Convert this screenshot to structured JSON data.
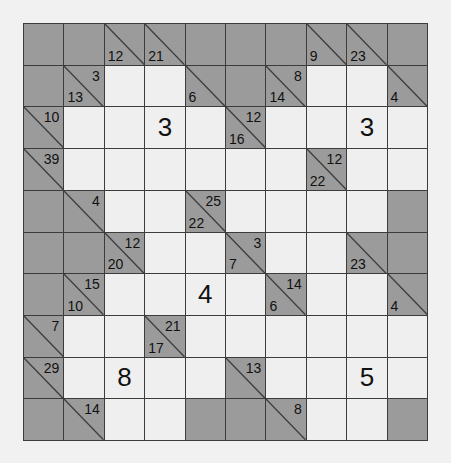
{
  "puzzle": {
    "type": "kakuro",
    "rows": 10,
    "cols": 10,
    "colors": {
      "background": "#f1f1f1",
      "white_cell": "#efefef",
      "block_cell": "#9b9b9b",
      "grid_line": "#3c3c3c",
      "text": "#111111"
    },
    "grid": [
      [
        {
          "t": "B"
        },
        {
          "t": "B"
        },
        {
          "t": "C",
          "d": "12"
        },
        {
          "t": "C",
          "d": "21"
        },
        {
          "t": "B"
        },
        {
          "t": "B"
        },
        {
          "t": "B"
        },
        {
          "t": "C",
          "d": "9"
        },
        {
          "t": "C",
          "d": "23"
        },
        {
          "t": "B"
        }
      ],
      [
        {
          "t": "B"
        },
        {
          "t": "C",
          "a": "3",
          "d": "13"
        },
        {
          "t": "W"
        },
        {
          "t": "W"
        },
        {
          "t": "C",
          "d": "6"
        },
        {
          "t": "B"
        },
        {
          "t": "C",
          "a": "8",
          "d": "14"
        },
        {
          "t": "W"
        },
        {
          "t": "W"
        },
        {
          "t": "C",
          "d": "4"
        }
      ],
      [
        {
          "t": "C",
          "a": "10"
        },
        {
          "t": "W"
        },
        {
          "t": "W"
        },
        {
          "t": "W",
          "v": "3"
        },
        {
          "t": "W"
        },
        {
          "t": "C",
          "a": "12",
          "d": "16"
        },
        {
          "t": "W"
        },
        {
          "t": "W"
        },
        {
          "t": "W",
          "v": "3"
        },
        {
          "t": "W"
        }
      ],
      [
        {
          "t": "C",
          "a": "39"
        },
        {
          "t": "W"
        },
        {
          "t": "W"
        },
        {
          "t": "W"
        },
        {
          "t": "W"
        },
        {
          "t": "W"
        },
        {
          "t": "W"
        },
        {
          "t": "C",
          "a": "12",
          "d": "22"
        },
        {
          "t": "W"
        },
        {
          "t": "W"
        }
      ],
      [
        {
          "t": "B"
        },
        {
          "t": "C",
          "a": "4"
        },
        {
          "t": "W"
        },
        {
          "t": "W"
        },
        {
          "t": "C",
          "a": "25",
          "d": "22"
        },
        {
          "t": "W"
        },
        {
          "t": "W"
        },
        {
          "t": "W"
        },
        {
          "t": "W"
        },
        {
          "t": "B"
        }
      ],
      [
        {
          "t": "B"
        },
        {
          "t": "B"
        },
        {
          "t": "C",
          "a": "12",
          "d": "20"
        },
        {
          "t": "W"
        },
        {
          "t": "W"
        },
        {
          "t": "C",
          "a": "3",
          "d": "7"
        },
        {
          "t": "W"
        },
        {
          "t": "W"
        },
        {
          "t": "C",
          "d": "23"
        },
        {
          "t": "B"
        }
      ],
      [
        {
          "t": "B"
        },
        {
          "t": "C",
          "a": "15",
          "d": "10"
        },
        {
          "t": "W"
        },
        {
          "t": "W"
        },
        {
          "t": "W",
          "v": "4"
        },
        {
          "t": "W"
        },
        {
          "t": "C",
          "a": "14",
          "d": "6"
        },
        {
          "t": "W"
        },
        {
          "t": "W"
        },
        {
          "t": "C",
          "d": "4"
        }
      ],
      [
        {
          "t": "C",
          "a": "7"
        },
        {
          "t": "W"
        },
        {
          "t": "W"
        },
        {
          "t": "C",
          "a": "21",
          "d": "17"
        },
        {
          "t": "W"
        },
        {
          "t": "W"
        },
        {
          "t": "W"
        },
        {
          "t": "W"
        },
        {
          "t": "W"
        },
        {
          "t": "W"
        }
      ],
      [
        {
          "t": "C",
          "a": "29"
        },
        {
          "t": "W"
        },
        {
          "t": "W",
          "v": "8"
        },
        {
          "t": "W"
        },
        {
          "t": "W"
        },
        {
          "t": "C",
          "a": "13"
        },
        {
          "t": "W"
        },
        {
          "t": "W"
        },
        {
          "t": "W",
          "v": "5"
        },
        {
          "t": "W"
        }
      ],
      [
        {
          "t": "B"
        },
        {
          "t": "C",
          "a": "14"
        },
        {
          "t": "W"
        },
        {
          "t": "W"
        },
        {
          "t": "B"
        },
        {
          "t": "B"
        },
        {
          "t": "C",
          "a": "8"
        },
        {
          "t": "W"
        },
        {
          "t": "W"
        },
        {
          "t": "B"
        }
      ]
    ]
  }
}
